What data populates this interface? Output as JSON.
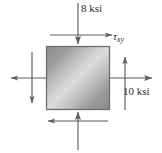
{
  "figure": {
    "type": "stress-element-diagram",
    "units": "ksi",
    "background_color": "#ffffff",
    "line_color": "#5a5a5a",
    "text_color": "#2b2b2b"
  },
  "element": {
    "name": "stress-element-square",
    "x": 46,
    "y": 46,
    "width": 64,
    "height": 64,
    "border_color": "#6b6b6b",
    "fill_gradient_from": "#8f8f8f",
    "fill_gradient_mid": "#d8d8d8",
    "fill_gradient_to": "#8c8c8c",
    "gradient_angle_deg": 45
  },
  "labels": {
    "sigma_y": "8 ksi",
    "sigma_x": "10 ksi",
    "tau_xy_symbol": "τ",
    "tau_xy_subscript": "xy"
  },
  "loads": [
    {
      "name": "normal-stress-top",
      "label": "8 ksi",
      "magnitude": 8,
      "units": "ksi",
      "face": "top",
      "direction": "down",
      "sense": "compression"
    },
    {
      "name": "normal-stress-bottom",
      "label": "8 ksi",
      "magnitude": 8,
      "units": "ksi",
      "face": "bottom",
      "direction": "up",
      "sense": "compression"
    },
    {
      "name": "normal-stress-right",
      "label": "10 ksi",
      "magnitude": 10,
      "units": "ksi",
      "face": "right",
      "direction": "right",
      "sense": "tension"
    },
    {
      "name": "normal-stress-left",
      "label": "10 ksi",
      "magnitude": 10,
      "units": "ksi",
      "face": "left",
      "direction": "left",
      "sense": "tension"
    },
    {
      "name": "shear-stress-top",
      "label": "τxy",
      "face": "top",
      "direction": "right"
    },
    {
      "name": "shear-stress-bottom",
      "label": "τxy",
      "face": "bottom",
      "direction": "left"
    },
    {
      "name": "shear-stress-right",
      "label": "τxy",
      "face": "right",
      "direction": "up"
    },
    {
      "name": "shear-stress-left",
      "label": "τxy",
      "face": "left",
      "direction": "down"
    }
  ]
}
